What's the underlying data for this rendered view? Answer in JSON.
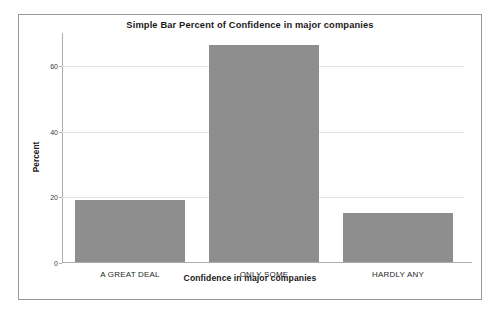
{
  "chart_data": {
    "type": "bar",
    "title": "Simple Bar Percent of Confidence in major companies",
    "xlabel": "Confidence in major companies",
    "ylabel": "Percent",
    "categories": [
      "A GREAT DEAL",
      "ONLY SOME",
      "HARDLY ANY"
    ],
    "values": [
      19,
      66,
      15
    ],
    "ylim": [
      0,
      70
    ],
    "yticks": [
      0,
      20,
      40,
      60
    ],
    "ytick_labels": [
      "0",
      "20",
      "40",
      "60"
    ],
    "grid": true,
    "legend": "none",
    "series": [
      {
        "name": "Percent",
        "values": [
          19,
          66,
          15
        ]
      }
    ],
    "colors": {
      "bar_fill": "#8e8e8e",
      "gridline": "#e3e3e3",
      "axis": "#adadad",
      "border": "#9a9a9a",
      "text": "#1a1a1a",
      "background": "#ffffff"
    }
  }
}
